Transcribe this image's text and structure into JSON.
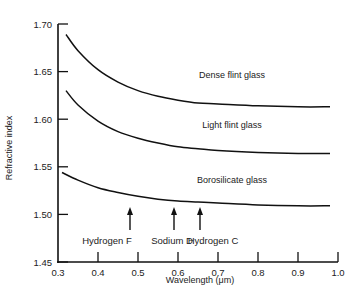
{
  "chart_data": {
    "type": "line",
    "title": "",
    "xlabel": "Wavelength (μm)",
    "ylabel": "Refractive index",
    "xlim": [
      0.3,
      1.0
    ],
    "ylim": [
      1.45,
      1.7
    ],
    "grid": false,
    "x_ticks": [
      "0.3",
      "0.4",
      "0.5",
      "0.6",
      "0.7",
      "0.8",
      "0.9",
      "1.0"
    ],
    "y_ticks": [
      "1.45",
      "1.50",
      "1.55",
      "1.60",
      "1.65",
      "1.70"
    ],
    "series": [
      {
        "name": "Dense flint glass",
        "x": [
          0.32,
          0.35,
          0.4,
          0.45,
          0.5,
          0.55,
          0.6,
          0.65,
          0.7,
          0.8,
          0.9,
          0.98
        ],
        "y": [
          1.689,
          1.672,
          1.652,
          1.639,
          1.63,
          1.624,
          1.62,
          1.617,
          1.616,
          1.614,
          1.613,
          1.613
        ]
      },
      {
        "name": "Light flint glass",
        "x": [
          0.32,
          0.35,
          0.4,
          0.45,
          0.5,
          0.55,
          0.6,
          0.65,
          0.7,
          0.8,
          0.9,
          0.98
        ],
        "y": [
          1.63,
          1.615,
          1.598,
          1.587,
          1.58,
          1.575,
          1.571,
          1.569,
          1.567,
          1.565,
          1.564,
          1.564
        ]
      },
      {
        "name": "Borosilicate glass",
        "x": [
          0.31,
          0.35,
          0.4,
          0.45,
          0.5,
          0.55,
          0.6,
          0.65,
          0.7,
          0.8,
          0.9,
          0.98
        ],
        "y": [
          1.544,
          1.536,
          1.528,
          1.523,
          1.519,
          1.516,
          1.514,
          1.513,
          1.512,
          1.51,
          1.509,
          1.509
        ]
      }
    ],
    "annotations": [
      {
        "label": "Hydrogen F",
        "x": 0.486
      },
      {
        "label": "Sodium D",
        "x": 0.589
      },
      {
        "label": "Hydrogen C",
        "x": 0.656
      }
    ],
    "legend": "inline labels above curves"
  }
}
